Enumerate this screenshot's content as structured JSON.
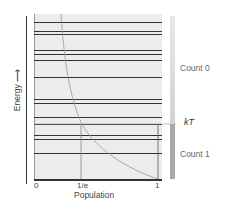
{
  "diagram": {
    "y_axis_label": "Energy",
    "x_axis_label": "Population",
    "x_ticks": [
      "0",
      "1/e",
      "1"
    ],
    "kT_label": "kT",
    "count_upper": "Count 0",
    "count_lower": "Count 1",
    "energy_levels_y": [
      22,
      31,
      34,
      50,
      54,
      60,
      77,
      99,
      103,
      117,
      124,
      135,
      139,
      153
    ],
    "colors": {
      "panel_bg": "#ececec",
      "level_line": "#333333",
      "curve": "#9a9a9a",
      "bar_upper": "#e2e2e2",
      "bar_lower": "#a8a8a8"
    }
  }
}
